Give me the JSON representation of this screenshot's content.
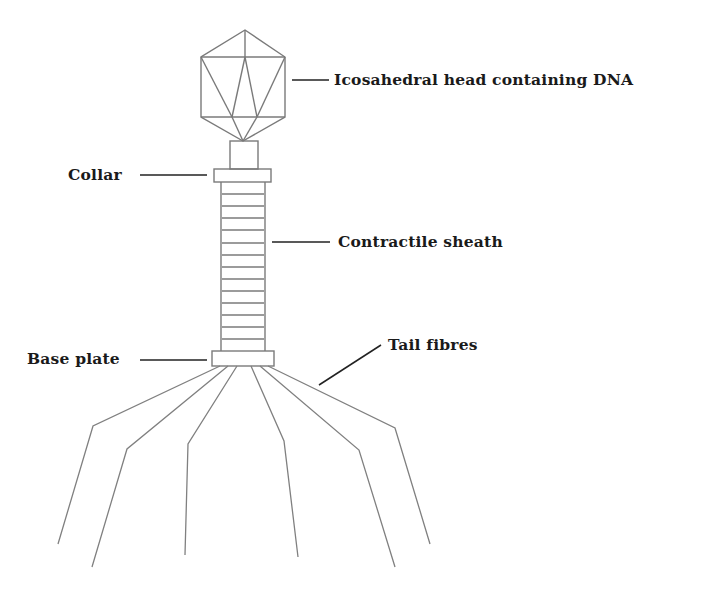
{
  "diagram": {
    "labels": {
      "head": "Icosahedral head containing DNA",
      "collar": "Collar",
      "sheath": "Contractile sheath",
      "base_plate": "Base plate",
      "tail_fibres": "Tail fibres"
    },
    "parts": [
      "icosahedral-head",
      "neck",
      "collar",
      "contractile-sheath",
      "base-plate",
      "tail-fibres"
    ],
    "sheath_segments": 14,
    "tail_fibre_count": 6,
    "colors": {
      "structure_stroke": "#7a7a7a",
      "leader_stroke": "#222222",
      "label_text": "#1a1a1a",
      "background": "#ffffff"
    }
  }
}
